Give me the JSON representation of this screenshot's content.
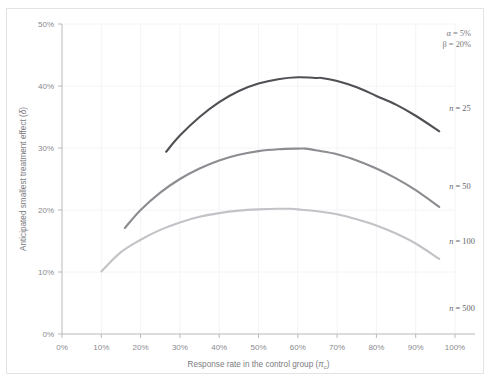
{
  "figure": {
    "top_caption_fragment": "",
    "frame_color": "#e3e3e6",
    "background": "#ffffff"
  },
  "annotations": {
    "alpha": "α = 5%",
    "beta": "β = 20%"
  },
  "chart_data": {
    "type": "line",
    "title": "",
    "subtitle": "",
    "xlabel_text": "Response rate in the control group (",
    "xlabel_symbol": "π",
    "xlabel_symbol_sub": "c",
    "xlabel_close": ")",
    "xlabel": "Response rate in the control group (πc)",
    "ylabel_text": "Anticipated smallest treatment effect (",
    "ylabel_symbol": "δ",
    "ylabel_close": ")",
    "ylabel": "Anticipated smallest treatment effect (δ)",
    "xlim": [
      0,
      100
    ],
    "ylim": [
      0,
      50
    ],
    "xticks": [
      0,
      10,
      20,
      30,
      40,
      50,
      60,
      70,
      80,
      90,
      100
    ],
    "xticklabels": [
      "0%",
      "10%",
      "20%",
      "30%",
      "40%",
      "50%",
      "60%",
      "70%",
      "80%",
      "90%",
      "100%"
    ],
    "yticks": [
      0,
      10,
      20,
      30,
      40,
      50
    ],
    "yticklabels": [
      "0%",
      "10%",
      "20%",
      "30%",
      "40%",
      "50%"
    ],
    "grid": "faint",
    "legend_position": "right-inline-labels",
    "annotations_text": [
      "α = 5%",
      "β = 20%"
    ],
    "series": [
      {
        "name": "n = 25",
        "color": "#4f4f54",
        "label_x": 96,
        "label_y": 36.5,
        "points": [
          {
            "x": 26.5,
            "y": 29.4
          },
          {
            "x": 30,
            "y": 32.0
          },
          {
            "x": 35,
            "y": 35.0
          },
          {
            "x": 40,
            "y": 37.4
          },
          {
            "x": 45,
            "y": 39.2
          },
          {
            "x": 50,
            "y": 40.4
          },
          {
            "x": 55,
            "y": 41.1
          },
          {
            "x": 60,
            "y": 41.4
          },
          {
            "x": 65,
            "y": 41.3
          },
          {
            "x": 66,
            "y": 41.3
          },
          {
            "x": 70,
            "y": 40.8
          },
          {
            "x": 75,
            "y": 39.8
          },
          {
            "x": 80,
            "y": 38.4
          },
          {
            "x": 85,
            "y": 37.0
          },
          {
            "x": 90,
            "y": 35.2
          },
          {
            "x": 96,
            "y": 32.7
          }
        ]
      },
      {
        "name": "n = 50",
        "color": "#8c8c91",
        "label_x": 96,
        "label_y": 23.8,
        "points": [
          {
            "x": 16,
            "y": 17.1
          },
          {
            "x": 20,
            "y": 20.0
          },
          {
            "x": 25,
            "y": 22.8
          },
          {
            "x": 30,
            "y": 25.0
          },
          {
            "x": 35,
            "y": 26.7
          },
          {
            "x": 40,
            "y": 28.0
          },
          {
            "x": 45,
            "y": 28.9
          },
          {
            "x": 50,
            "y": 29.5
          },
          {
            "x": 55,
            "y": 29.8
          },
          {
            "x": 60,
            "y": 29.9
          },
          {
            "x": 62,
            "y": 29.9
          },
          {
            "x": 65,
            "y": 29.6
          },
          {
            "x": 70,
            "y": 29.0
          },
          {
            "x": 75,
            "y": 28.0
          },
          {
            "x": 80,
            "y": 26.7
          },
          {
            "x": 85,
            "y": 25.1
          },
          {
            "x": 90,
            "y": 23.2
          },
          {
            "x": 96,
            "y": 20.5
          }
        ]
      },
      {
        "name": "n = 100",
        "color": "#c3c3c7",
        "label_x": 96,
        "label_y": 15.0,
        "points": [
          {
            "x": 10,
            "y": 10.1
          },
          {
            "x": 15,
            "y": 13.2
          },
          {
            "x": 20,
            "y": 15.2
          },
          {
            "x": 25,
            "y": 16.8
          },
          {
            "x": 30,
            "y": 18.0
          },
          {
            "x": 35,
            "y": 18.9
          },
          {
            "x": 40,
            "y": 19.5
          },
          {
            "x": 45,
            "y": 19.9
          },
          {
            "x": 50,
            "y": 20.1
          },
          {
            "x": 55,
            "y": 20.2
          },
          {
            "x": 58,
            "y": 20.2
          },
          {
            "x": 60,
            "y": 20.1
          },
          {
            "x": 65,
            "y": 19.8
          },
          {
            "x": 70,
            "y": 19.3
          },
          {
            "x": 75,
            "y": 18.5
          },
          {
            "x": 80,
            "y": 17.5
          },
          {
            "x": 85,
            "y": 16.2
          },
          {
            "x": 90,
            "y": 14.6
          },
          {
            "x": 96,
            "y": 12.1
          }
        ]
      },
      {
        "name": "n = 500",
        "color": "#e0e0e3",
        "label_x": 96,
        "label_y": 4.2,
        "points": []
      }
    ]
  }
}
